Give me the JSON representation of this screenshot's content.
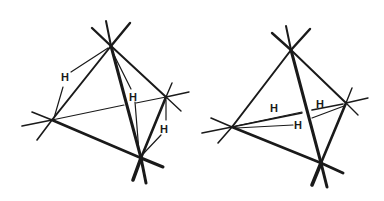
{
  "figures": [
    {
      "name": "left-tetrahedron",
      "labels": [
        {
          "text": "H",
          "x": 66,
          "y": 81
        },
        {
          "text": "H",
          "x": 134,
          "y": 100
        },
        {
          "text": "H",
          "x": 165,
          "y": 132
        }
      ]
    },
    {
      "name": "right-tetrahedron",
      "labels": [
        {
          "text": "H",
          "x": 275,
          "y": 112
        },
        {
          "text": "H",
          "x": 322,
          "y": 107
        },
        {
          "text": "H",
          "x": 299,
          "y": 128
        }
      ]
    }
  ],
  "colors": {
    "line": "#1a1a1a",
    "background": "#ffffff"
  }
}
